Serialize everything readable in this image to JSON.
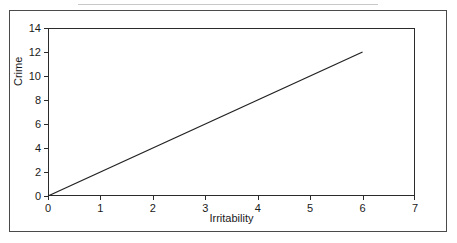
{
  "figure": {
    "background_color": "#ffffff",
    "border_color": "#4a4a4a",
    "axis_color": "#2b2b2b",
    "line_color": "#222222"
  },
  "chart_data": {
    "type": "line",
    "title": "",
    "subtitle": "",
    "xlabel": "Irritability",
    "ylabel": "Crime",
    "xlim": [
      0,
      7
    ],
    "ylim": [
      0,
      14
    ],
    "xticks": [
      "0",
      "1",
      "2",
      "3",
      "4",
      "5",
      "6",
      "7"
    ],
    "yticks": [
      "0",
      "2",
      "4",
      "6",
      "8",
      "10",
      "12",
      "14"
    ],
    "xtick_values": [
      0,
      1,
      2,
      3,
      4,
      5,
      6,
      7
    ],
    "ytick_values": [
      0,
      2,
      4,
      6,
      8,
      10,
      12,
      14
    ],
    "grid": false,
    "legend": null,
    "legend_position": "none",
    "annotations": [],
    "series": [
      {
        "name": "Crime vs Irritability",
        "x": [
          0,
          6
        ],
        "values": [
          0,
          12
        ],
        "slope": 2,
        "intercept": 0,
        "color": "#222222"
      }
    ]
  }
}
